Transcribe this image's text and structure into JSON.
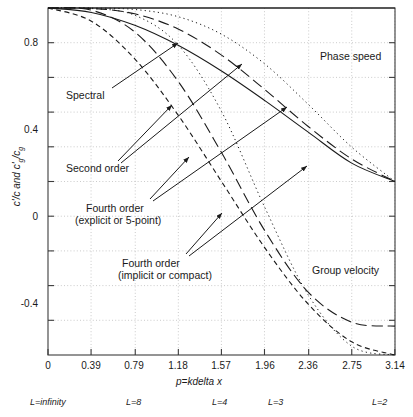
{
  "chart_data": {
    "type": "line",
    "title": "",
    "xlabel": "p=kdelta x",
    "ylabel": "c'/c and c'g/cg",
    "xlim": [
      0,
      3.14159
    ],
    "ylim": [
      -1.0,
      1.0
    ],
    "grid": true,
    "legend_position": "inline-annotations",
    "xticks": [
      "0",
      "0.39",
      "0.79",
      "1.18",
      "1.57",
      "1.96",
      "2.36",
      "2.75",
      "3.14"
    ],
    "xtick_values": [
      0,
      0.39,
      0.79,
      1.18,
      1.57,
      1.96,
      2.36,
      2.75,
      3.14
    ],
    "yticks": [
      "0.8",
      "0.4",
      "0",
      "-0.4",
      "-0.8"
    ],
    "ytick_values": [
      0.8,
      0.4,
      0,
      -0.4,
      -0.8
    ],
    "yminor_values": [
      0.6,
      0.2,
      -0.2,
      -0.6
    ],
    "secondary_axis_labels": [
      {
        "text": "L=infinity",
        "x": 0.1
      },
      {
        "text": "L=8",
        "x": 0.79
      },
      {
        "text": "L=4",
        "x": 1.57
      },
      {
        "text": "L=3",
        "x": 2.09
      },
      {
        "text": "L=2",
        "x": 3.05
      }
    ],
    "series": [
      {
        "name": "Spectral",
        "style": "solid-horizontal",
        "quantity": "phase speed and group velocity",
        "x": [
          0,
          0.3927,
          0.7854,
          1.1781,
          1.5708,
          1.9635,
          2.3562,
          2.7489,
          3.1416
        ],
        "y": [
          1.0,
          1.0,
          1.0,
          1.0,
          1.0,
          1.0,
          1.0,
          1.0,
          1.0
        ]
      },
      {
        "name": "Second order phase speed",
        "style": "solid",
        "quantity": "phase speed",
        "x": [
          0,
          0.3927,
          0.7854,
          1.1781,
          1.5708,
          1.9635,
          2.3562,
          2.7489,
          3.1416
        ],
        "y": [
          1.0,
          0.9745,
          0.9003,
          0.7849,
          0.6366,
          0.466,
          0.2846,
          0.106,
          0.0
        ]
      },
      {
        "name": "Second order group velocity",
        "style": "short-dash",
        "quantity": "group velocity",
        "x": [
          0,
          0.3927,
          0.7854,
          1.1781,
          1.5708,
          1.9635,
          2.3562,
          2.7489,
          3.1416
        ],
        "y": [
          1.0,
          0.9239,
          0.7071,
          0.3827,
          0.0,
          -0.3827,
          -0.7071,
          -0.9239,
          -1.0
        ]
      },
      {
        "name": "Fourth order explicit phase speed",
        "style": "long-dash",
        "quantity": "phase speed",
        "x": [
          0,
          0.3927,
          0.7854,
          1.1781,
          1.5708,
          1.9635,
          2.3562,
          2.7489,
          3.1416
        ],
        "y": [
          1.0,
          0.9977,
          0.9664,
          0.8789,
          0.7284,
          0.5294,
          0.3169,
          0.1303,
          0.0
        ]
      },
      {
        "name": "Fourth order explicit group velocity",
        "style": "long-dash",
        "quantity": "group velocity",
        "x": [
          0,
          0.3927,
          0.7854,
          1.1781,
          1.5708,
          1.9635,
          2.3562,
          2.7489,
          3.1416
        ],
        "y": [
          1.0,
          0.9877,
          0.8619,
          0.5774,
          0.1667,
          -0.2845,
          -0.638,
          -0.8106,
          -0.8333
        ]
      },
      {
        "name": "Fourth order compact phase speed",
        "style": "dotted",
        "quantity": "phase speed",
        "x": [
          0,
          0.3927,
          0.7854,
          1.1781,
          1.5708,
          1.9635,
          2.3562,
          2.7489,
          3.1416
        ],
        "y": [
          1.0,
          0.9996,
          0.9914,
          0.9499,
          0.8488,
          0.6768,
          0.4445,
          0.1986,
          0.0
        ]
      },
      {
        "name": "Fourth order compact group velocity",
        "style": "dotted",
        "quantity": "group velocity",
        "x": [
          0,
          0.3927,
          0.7854,
          1.1781,
          1.5708,
          1.9635,
          2.3562,
          2.7489,
          3.1416
        ],
        "y": [
          1.0,
          0.9972,
          0.9584,
          0.7871,
          0.404,
          -0.1508,
          -0.654,
          -0.9487,
          -1.0
        ]
      }
    ],
    "annotations": [
      {
        "id": "spectral",
        "text": "Spectral"
      },
      {
        "id": "second_order",
        "text": "Second order"
      },
      {
        "id": "fourth_order_explicit_line1",
        "text": "Fourth order"
      },
      {
        "id": "fourth_order_explicit_line2",
        "text": "(explicit or 5-point)"
      },
      {
        "id": "fourth_order_compact_line1",
        "text": "Fourth order"
      },
      {
        "id": "fourth_order_compact_line2",
        "text": "(implicit or compact)"
      },
      {
        "id": "phase_speed",
        "text": "Phase speed"
      },
      {
        "id": "group_velocity",
        "text": "Group velocity"
      }
    ],
    "colors": {
      "line": "#1a1a1a",
      "grid": "#b4b4b4",
      "axis": "#3c3c3c",
      "background": "#ffffff"
    }
  },
  "axis": {
    "y_label_html": "c'/c and c'<sub>g</sub>/c<sub>g</sub>",
    "x_label_prefix": "p",
    "x_label_rest": "=kdelta x"
  },
  "ticks": {
    "y": [
      "0.8",
      "0.4",
      "0",
      "-0.4",
      "-0.8"
    ],
    "x": [
      "0",
      "0.39",
      "0.79",
      "1.18",
      "1.57",
      "1.96",
      "2.36",
      "2.75",
      "3.14"
    ]
  },
  "sublabels": {
    "l_infinity": "L=infinity",
    "l_8": "L=8",
    "l_4": "L=4",
    "l_3": "L=3",
    "l_2": "L=2"
  },
  "annotations": {
    "spectral": "Spectral",
    "second_order": "Second order",
    "fourth_explicit_1": "Fourth order",
    "fourth_explicit_2": "(explicit or 5-point)",
    "fourth_compact_1": "Fourth order",
    "fourth_compact_2": "(implicit or compact)",
    "phase_speed": "Phase speed",
    "group_velocity": "Group velocity"
  }
}
